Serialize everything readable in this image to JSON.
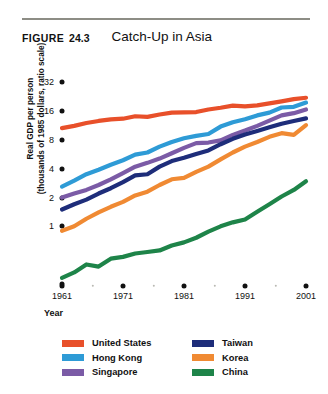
{
  "figure": {
    "tag": "FIGURE",
    "number": "24.3",
    "title": "Catch-Up in Asia"
  },
  "chart_data": {
    "type": "line",
    "title": "Catch-Up in Asia",
    "xlabel": "Year",
    "ylabel": "Real GDP per person (thousands of 1985 dollars, ratio scale)",
    "ylabel_lines": [
      "Real GDP per person",
      "(thousands of 1985 dollars, ratio scale)"
    ],
    "scale": "log",
    "grid": false,
    "legend_position": "below",
    "xlim": [
      1961,
      2001
    ],
    "ylim": [
      0.25,
      45
    ],
    "ytick_labels": [
      "32",
      "16",
      "8",
      "4",
      "2",
      "1"
    ],
    "ytick_values": [
      32,
      16,
      8,
      4,
      2,
      1
    ],
    "xtick_labels": [
      "1961",
      "1971",
      "1981",
      "1991",
      "2001"
    ],
    "xtick_values": [
      1961,
      1971,
      1981,
      1991,
      2001
    ],
    "x": [
      1961,
      1963,
      1965,
      1967,
      1969,
      1971,
      1973,
      1975,
      1977,
      1979,
      1981,
      1983,
      1985,
      1987,
      1989,
      1991,
      1993,
      1995,
      1997,
      1999,
      2001
    ],
    "series": [
      {
        "name": "United States",
        "color": "#E8502A",
        "values": [
          10.6,
          11.2,
          12.0,
          12.6,
          13.1,
          13.3,
          14.1,
          13.9,
          14.7,
          15.4,
          15.5,
          15.6,
          16.6,
          17.3,
          18.2,
          17.9,
          18.3,
          19.2,
          20.2,
          21.3,
          22.0
        ]
      },
      {
        "name": "Hong Kong",
        "color": "#2E9BD6",
        "values": [
          2.6,
          3.0,
          3.5,
          3.9,
          4.4,
          4.9,
          5.6,
          5.9,
          6.8,
          7.6,
          8.3,
          8.8,
          9.2,
          11.0,
          12.2,
          13.1,
          14.4,
          15.4,
          17.4,
          17.7,
          19.6
        ]
      },
      {
        "name": "Singapore",
        "color": "#7B5BA6",
        "values": [
          2.0,
          2.2,
          2.4,
          2.7,
          3.1,
          3.6,
          4.2,
          4.6,
          5.1,
          5.8,
          6.6,
          7.4,
          7.5,
          7.9,
          9.0,
          10.0,
          11.2,
          12.7,
          14.4,
          15.2,
          16.6
        ]
      },
      {
        "name": "Taiwan",
        "color": "#1E2D7A",
        "values": [
          1.5,
          1.7,
          1.9,
          2.2,
          2.5,
          2.9,
          3.4,
          3.5,
          4.2,
          4.8,
          5.2,
          5.7,
          6.2,
          7.2,
          8.2,
          9.1,
          9.9,
          10.8,
          11.8,
          12.6,
          13.4
        ]
      },
      {
        "name": "Korea",
        "color": "#F08A33",
        "values": [
          0.9,
          1.0,
          1.2,
          1.4,
          1.6,
          1.8,
          2.1,
          2.3,
          2.7,
          3.1,
          3.2,
          3.7,
          4.2,
          5.0,
          5.9,
          6.8,
          7.6,
          8.6,
          9.4,
          9.0,
          11.4
        ]
      },
      {
        "name": "China",
        "color": "#1E8449",
        "values": [
          0.29,
          0.33,
          0.4,
          0.38,
          0.46,
          0.48,
          0.52,
          0.54,
          0.56,
          0.63,
          0.68,
          0.76,
          0.88,
          1.0,
          1.1,
          1.18,
          1.42,
          1.7,
          2.05,
          2.4,
          2.95
        ]
      }
    ]
  },
  "legend": {
    "items": [
      {
        "label": "United States",
        "color": "#E8502A"
      },
      {
        "label": "Taiwan",
        "color": "#1E2D7A"
      },
      {
        "label": "Hong Kong",
        "color": "#2E9BD6"
      },
      {
        "label": "Korea",
        "color": "#F08A33"
      },
      {
        "label": "Singapore",
        "color": "#7B5BA6"
      },
      {
        "label": "China",
        "color": "#1E8449"
      }
    ]
  }
}
